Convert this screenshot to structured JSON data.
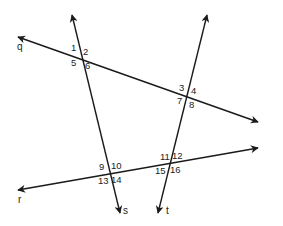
{
  "diagram": {
    "colors": {
      "line": "#1a1a1a",
      "text": "#222222",
      "background": "#ffffff"
    },
    "lines": [
      {
        "name": "q",
        "label": "q",
        "x1": 18,
        "y1": 37,
        "x2": 258,
        "y2": 122,
        "label_x": 17,
        "label_y": 50
      },
      {
        "name": "r",
        "label": "r",
        "x1": 18,
        "y1": 190,
        "x2": 258,
        "y2": 148,
        "label_x": 18,
        "label_y": 203
      },
      {
        "name": "s",
        "label": "s",
        "x1": 72,
        "y1": 15,
        "x2": 120,
        "y2": 213,
        "label_x": 123,
        "label_y": 214
      },
      {
        "name": "t",
        "label": "t",
        "x1": 207,
        "y1": 15,
        "x2": 158,
        "y2": 213,
        "label_x": 166,
        "label_y": 214
      }
    ],
    "intersections": [
      {
        "lines": [
          "q",
          "s"
        ],
        "angles": [
          {
            "label": "1",
            "x": 71,
            "y": 51
          },
          {
            "label": "2",
            "x": 83,
            "y": 55
          },
          {
            "label": "5",
            "x": 71,
            "y": 66
          },
          {
            "label": "6",
            "x": 85,
            "y": 69
          }
        ]
      },
      {
        "lines": [
          "q",
          "t"
        ],
        "angles": [
          {
            "label": "3",
            "x": 179,
            "y": 91
          },
          {
            "label": "4",
            "x": 191,
            "y": 94
          },
          {
            "label": "7",
            "x": 177,
            "y": 104
          },
          {
            "label": "8",
            "x": 189,
            "y": 108
          }
        ]
      },
      {
        "lines": [
          "r",
          "s"
        ],
        "angles": [
          {
            "label": "9",
            "x": 99,
            "y": 170
          },
          {
            "label": "10",
            "x": 111,
            "y": 169
          },
          {
            "label": "13",
            "x": 98,
            "y": 184
          },
          {
            "label": "14",
            "x": 111,
            "y": 183
          }
        ]
      },
      {
        "lines": [
          "r",
          "t"
        ],
        "angles": [
          {
            "label": "11",
            "x": 160,
            "y": 160
          },
          {
            "label": "12",
            "x": 172,
            "y": 159
          },
          {
            "label": "15",
            "x": 155,
            "y": 174
          },
          {
            "label": "16",
            "x": 170,
            "y": 173
          }
        ]
      }
    ]
  }
}
